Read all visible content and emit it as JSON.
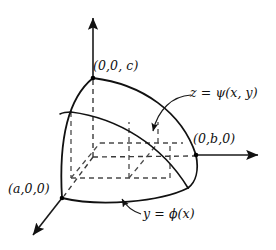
{
  "figure": {
    "background_color": "#ffffff",
    "line_color": "#111111",
    "width": 276,
    "height": 250
  },
  "labels": {
    "point_c": "(0,0, c)",
    "point_b": "(0,b,0)",
    "point_a": "(a,0,0)",
    "surface_z": "z = ψ(x, y)",
    "curve_y": "y = ϕ(x)"
  },
  "axes": [
    {
      "name": "z-axis",
      "direction": "up",
      "arrow": true
    },
    {
      "name": "y-axis",
      "direction": "right",
      "arrow": true
    },
    {
      "name": "x-axis",
      "direction": "down-left",
      "arrow": true
    }
  ],
  "vertices": [
    {
      "name": "origin",
      "label": "",
      "x": 93,
      "y": 157
    },
    {
      "name": "z-intercept",
      "label": "(0,0, c)",
      "x": 93,
      "y": 78
    },
    {
      "name": "y-intercept",
      "label": "(0,b,0)",
      "x": 196,
      "y": 155
    },
    {
      "name": "x-intercept",
      "label": "(a,0,0)",
      "x": 62,
      "y": 198
    }
  ],
  "annotations": [
    {
      "name": "psi-annotation",
      "text": "z = ψ(x, y)",
      "points_to": "upper surface"
    },
    {
      "name": "phi-annotation",
      "text": "y = ϕ(x)",
      "points_to": "lower boundary curve"
    }
  ]
}
